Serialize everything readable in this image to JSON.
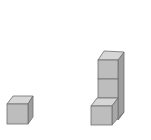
{
  "figure": {
    "colors": {
      "front": "#bdbdbd",
      "top": "#d6d6d6",
      "side": "#9e9e9e",
      "edge": "#6e6e6e",
      "background": "#ffffff"
    },
    "groups": [
      {
        "name": "single-cube",
        "cube_count": 1
      },
      {
        "name": "cube-tower",
        "cube_count": 3
      }
    ]
  }
}
